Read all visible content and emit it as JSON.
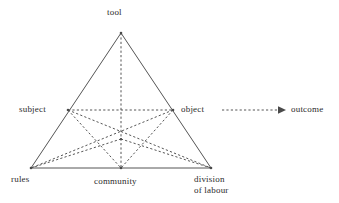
{
  "diagram": {
    "type": "activity-theory-triangle",
    "background_color": "#ffffff",
    "line_color": "#555555",
    "dashed_line_color": "#555555",
    "text_color": "#2b2b2b",
    "nodes": {
      "tool": {
        "label": "tool",
        "x": 121,
        "y": 33
      },
      "subject": {
        "label": "subject",
        "x": 68,
        "y": 110
      },
      "object": {
        "label": "object",
        "x": 173,
        "y": 110
      },
      "rules": {
        "label": "rules",
        "x": 31,
        "y": 168
      },
      "community": {
        "label": "community",
        "x": 121,
        "y": 168
      },
      "division": {
        "label_line1": "division",
        "label_line2": "of labour",
        "label": "division of labour",
        "x": 211,
        "y": 168
      },
      "outcome": {
        "label": "outcome",
        "x": 293,
        "y": 110
      },
      "center": {
        "label": "center",
        "x": 121,
        "y": 139
      }
    },
    "solid_edges": [
      {
        "name": "tool-to-rules",
        "from": "tool",
        "to": "rules"
      },
      {
        "name": "tool-to-division",
        "from": "tool",
        "to": "division"
      },
      {
        "name": "rules-to-division",
        "from": "rules",
        "to": "division"
      }
    ],
    "dashed_edges": [
      {
        "name": "subject-to-object",
        "from": "subject",
        "to": "object"
      },
      {
        "name": "tool-to-community",
        "from": "tool",
        "to": "community"
      },
      {
        "name": "subject-to-division",
        "from": "subject",
        "to": "division"
      },
      {
        "name": "object-to-rules",
        "from": "object",
        "to": "rules"
      },
      {
        "name": "subject-to-community",
        "from": "subject",
        "to": "community"
      },
      {
        "name": "object-to-community",
        "from": "object",
        "to": "community"
      },
      {
        "name": "rules-to-center",
        "from": "rules",
        "to": "center"
      },
      {
        "name": "division-to-center",
        "from": "division",
        "to": "center"
      }
    ],
    "arrow": {
      "name": "object-to-outcome-arrow",
      "from_x": 222,
      "from_y": 110,
      "to_x": 285,
      "to_y": 110,
      "style": "dashed",
      "head": "filled-triangle"
    }
  }
}
